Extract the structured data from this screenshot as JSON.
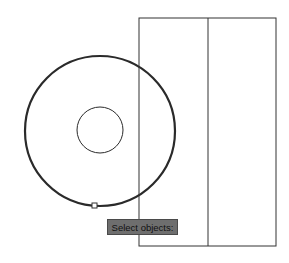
{
  "drawing": {
    "outer_circle": {
      "cx": 100,
      "cy": 131,
      "r": 75,
      "stroke": "#2a2a2a"
    },
    "inner_circle": {
      "cx": 100,
      "cy": 130,
      "r": 23,
      "stroke": "#2a2a2a"
    },
    "rectangle": {
      "x": 139,
      "y": 18,
      "width": 137,
      "height": 228,
      "stroke": "#333333"
    },
    "divider_x": 208,
    "grip": {
      "x": 92,
      "y": 203,
      "size": 5
    }
  },
  "tooltip": {
    "text": "Select objects:",
    "bg": "#6e6e6e"
  }
}
